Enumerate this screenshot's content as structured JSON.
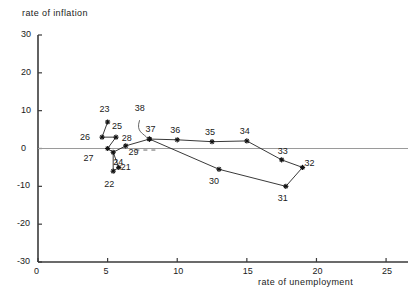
{
  "chart_data": {
    "type": "scatter",
    "title": "",
    "xlabel": "rate of unemployment",
    "ylabel": "rate of inflation",
    "xlim": [
      0,
      26
    ],
    "ylim": [
      -30,
      30
    ],
    "xticks": [
      "0",
      "5",
      "10",
      "15",
      "20",
      "25"
    ],
    "xtick_values": [
      0,
      5,
      10,
      15,
      20,
      25
    ],
    "yticks": [
      "30",
      "20",
      "10",
      "0",
      "-10",
      "-20",
      "-30"
    ],
    "ytick_values": [
      30,
      20,
      10,
      0,
      -10,
      -20,
      -30
    ],
    "grid": false,
    "zero_line": true,
    "legend": "none",
    "marker": "star",
    "connected": true,
    "series": [
      {
        "name": "Phillips loop",
        "point_labels": [
          "21",
          "22",
          "23",
          "24",
          "25",
          "26",
          "27",
          "28",
          "29",
          "30",
          "31",
          "32",
          "33",
          "34",
          "35",
          "36",
          "37",
          "38"
        ],
        "points": [
          {
            "label": "21",
            "x": 5.8,
            "y": -5.0,
            "label_dx": 7,
            "label_dy": 1
          },
          {
            "label": "22",
            "x": 5.4,
            "y": -6.0,
            "label_dx": -4,
            "label_dy": 14
          },
          {
            "label": "23",
            "x": 5.0,
            "y": 7.0,
            "label_dx": -3,
            "label_dy": -12
          },
          {
            "label": "24",
            "x": 5.4,
            "y": -1.0,
            "label_dx": 5,
            "label_dy": 11
          },
          {
            "label": "25",
            "x": 5.6,
            "y": 3.0,
            "label_dx": 1,
            "label_dy": -10
          },
          {
            "label": "26",
            "x": 4.6,
            "y": 3.0,
            "label_dx": -17,
            "label_dy": 1
          },
          {
            "label": "27",
            "x": 5.0,
            "y": 0.0,
            "label_dx": -19,
            "label_dy": 10
          },
          {
            "label": "28",
            "x": 6.3,
            "y": 0.7,
            "label_dx": 1,
            "label_dy": -7
          },
          {
            "label": "29",
            "x": 8.0,
            "y": 2.5,
            "label_dx": -16,
            "label_dy": 14
          },
          {
            "label": "30",
            "x": 13.0,
            "y": -5.5,
            "label_dx": -5,
            "label_dy": 13
          },
          {
            "label": "31",
            "x": 17.8,
            "y": -10.0,
            "label_dx": -3,
            "label_dy": 13
          },
          {
            "label": "32",
            "x": 19.0,
            "y": -5.0,
            "label_dx": 7,
            "label_dy": -3
          },
          {
            "label": "33",
            "x": 17.5,
            "y": -3.0,
            "label_dx": 1,
            "label_dy": -8
          },
          {
            "label": "34",
            "x": 15.0,
            "y": 2.0,
            "label_dx": -2,
            "label_dy": -9
          },
          {
            "label": "35",
            "x": 12.5,
            "y": 1.8,
            "label_dx": -2,
            "label_dy": -9
          },
          {
            "label": "36",
            "x": 10.0,
            "y": 2.3,
            "label_dx": -2,
            "label_dy": -9
          },
          {
            "label": "37",
            "x": 8.0,
            "y": 2.5,
            "label_dx": 1,
            "label_dy": -9
          },
          {
            "label": "38",
            "x": 7.3,
            "y": 8.0,
            "label_dx": 0,
            "label_dy": -9
          }
        ],
        "path_order": [
          "23",
          "26",
          "25",
          "27",
          "24",
          "22",
          "21",
          "24",
          "28",
          "29",
          "36",
          "35",
          "34",
          "33",
          "32",
          "31",
          "30",
          "29"
        ]
      }
    ]
  }
}
